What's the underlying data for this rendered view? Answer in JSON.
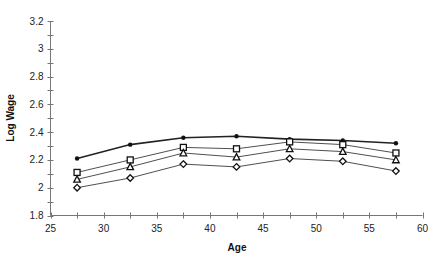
{
  "chart_data": {
    "type": "line",
    "title": "",
    "xlabel": "Age",
    "ylabel": "Log Wage",
    "xlim": [
      25,
      60
    ],
    "ylim": [
      1.8,
      3.2
    ],
    "xticks": [
      25,
      30,
      35,
      40,
      45,
      50,
      55,
      60
    ],
    "yticks": [
      1.8,
      2,
      2.2,
      2.4,
      2.6,
      2.8,
      3,
      3.2
    ],
    "ytick_labels": [
      "1.8",
      "2",
      "2.2",
      "2.4",
      "2.6",
      "2.8",
      "3",
      "3.2"
    ],
    "grid": false,
    "legend": null,
    "x": [
      27.5,
      32.5,
      37.5,
      42.5,
      47.5,
      52.5,
      57.5
    ],
    "series": [
      {
        "name": "filled-circle",
        "marker": "circle-filled",
        "line_width": 1.6,
        "values": [
          2.21,
          2.31,
          2.36,
          2.37,
          2.35,
          2.34,
          2.32
        ]
      },
      {
        "name": "square",
        "marker": "square-open",
        "line_width": 0.8,
        "values": [
          2.11,
          2.2,
          2.29,
          2.28,
          2.33,
          2.31,
          2.25
        ]
      },
      {
        "name": "triangle",
        "marker": "triangle-open",
        "line_width": 0.8,
        "values": [
          2.06,
          2.15,
          2.25,
          2.22,
          2.28,
          2.26,
          2.2
        ]
      },
      {
        "name": "diamond",
        "marker": "diamond-open",
        "line_width": 0.8,
        "values": [
          2.0,
          2.07,
          2.17,
          2.15,
          2.21,
          2.19,
          2.12
        ]
      }
    ]
  },
  "colors": {
    "axis": "#777777",
    "line": "#222222",
    "marker": "#111111",
    "background": "#ffffff"
  }
}
